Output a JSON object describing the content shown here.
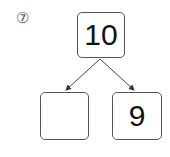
{
  "problem": {
    "number_label": "⑦",
    "top_box": "10",
    "bottom_left_box": "",
    "bottom_right_box": "9"
  }
}
